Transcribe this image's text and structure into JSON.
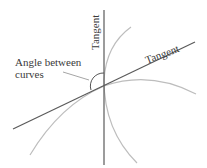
{
  "diagram": {
    "labels": {
      "tangent_vertical": "Tangent",
      "tangent_diagonal": "Tangent",
      "angle_line1": "Angle between",
      "angle_line2": "curves"
    },
    "colors": {
      "tangent": "#555555",
      "curve": "#b8b8b8",
      "text": "#3a3a3a"
    }
  }
}
